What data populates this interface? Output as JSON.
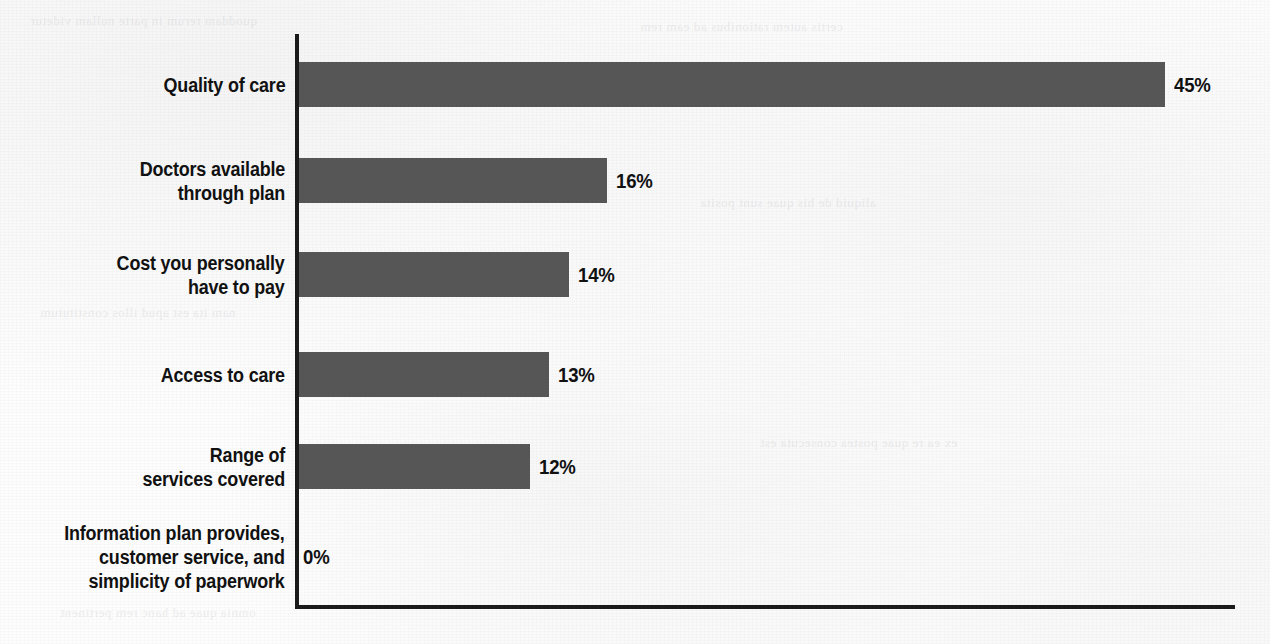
{
  "chart_data": {
    "type": "bar",
    "orientation": "horizontal",
    "title": "",
    "subtitle": "",
    "xlabel": "",
    "ylabel": "",
    "grid": false,
    "legend": null,
    "axis_range": [
      0,
      49
    ],
    "value_suffix": "%",
    "categories": [
      "Quality of care",
      "Doctors available\nthrough plan",
      "Cost you personally\nhave to pay",
      "Access to care",
      "Range of\nservices covered",
      "Information plan provides,\ncustomer service, and\nsimplicity of paperwork"
    ],
    "values": [
      45,
      16,
      14,
      13,
      12,
      0
    ],
    "value_labels": [
      "45%",
      "16%",
      "14%",
      "13%",
      "12%",
      "0%"
    ],
    "colors": {
      "bar": "#565656",
      "axis": "#1b1b1b",
      "text": "#111111",
      "background": "#fdfdfd"
    }
  },
  "scan_artifacts": {
    "bleed_line_1": "quoddam rerum in parte nullam videtur",
    "bleed_line_2": "certis autem rationibus ad eam rem",
    "bleed_line_3": "aliquid de his quae sunt posita",
    "bleed_line_4": "nam ita est apud illos constitutum",
    "bleed_line_5": "ex ea re quae postea consecuta est",
    "bleed_line_6": "omnia quae ad hanc rem pertinent"
  }
}
